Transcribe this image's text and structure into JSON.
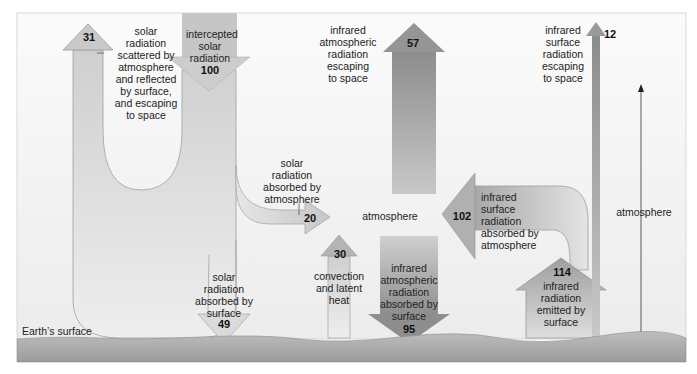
{
  "diagram": {
    "surface_label": "Earth’s surface",
    "atmosphere_center_label": "atmosphere",
    "atmosphere_side_label": "atmosphere",
    "colors": {
      "background": "#f4f4f4",
      "surface_top": "#bdbdbd",
      "surface_bottom": "#9a9a9a",
      "light_arrow": "#dcdcdc",
      "mid_arrow": "#bcbcbc",
      "dark_arrow": "#8f8f8f",
      "outline": "#9a9a9a"
    },
    "flows": [
      {
        "id": "intercepted",
        "value": "100",
        "label": [
          "intercepted",
          "solar",
          "radiation"
        ]
      },
      {
        "id": "scattered",
        "value": "31",
        "label": [
          "solar",
          "radiation",
          "scattered by",
          "atmosphere",
          "and reflected",
          "by surface,",
          "and escaping",
          "to space"
        ]
      },
      {
        "id": "absorbed_atmosphere",
        "value": "20",
        "label": [
          "solar",
          "radiation",
          "absorbed by",
          "atmosphere"
        ]
      },
      {
        "id": "absorbed_surface",
        "value": "49",
        "label": [
          "solar",
          "radiation",
          "absorbed by",
          "surface"
        ]
      },
      {
        "id": "convection",
        "value": "30",
        "label": [
          "convection",
          "and latent",
          "heat"
        ]
      },
      {
        "id": "ir_atm_escaping",
        "value": "57",
        "label": [
          "infrared",
          "atmospheric",
          "radiation",
          "escaping",
          "to space"
        ]
      },
      {
        "id": "ir_atm_absorbed_surface",
        "value": "95",
        "label": [
          "infrared",
          "atmospheric",
          "radiation",
          "absorbed by",
          "surface"
        ]
      },
      {
        "id": "ir_surface_absorbed_atm",
        "value": "102",
        "label": [
          "infrared",
          "surface",
          "radiation",
          "absorbed by",
          "atmosphere"
        ]
      },
      {
        "id": "ir_emitted_surface",
        "value": "114",
        "label": [
          "infrared",
          "radiation",
          "emitted by",
          "surface"
        ]
      },
      {
        "id": "ir_surface_escaping",
        "value": "12",
        "label": [
          "infrared",
          "surface",
          "radiation",
          "escaping",
          "to space"
        ]
      }
    ]
  }
}
